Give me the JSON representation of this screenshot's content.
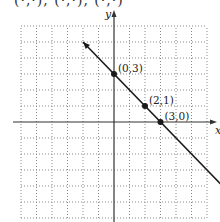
{
  "header": {
    "clipped_text": "(·,·), (·,·), (·,·)"
  },
  "chart_data": {
    "type": "line",
    "title": "",
    "xlabel": "x",
    "ylabel": "y",
    "xlim": [
      -6,
      6
    ],
    "ylim": [
      -6,
      6
    ],
    "grid": true,
    "grid_style": "dotted",
    "series": [
      {
        "name": "line",
        "equation": "y = -x + 3",
        "x": [
          -2,
          7.5
        ],
        "y": [
          5,
          -4.5
        ]
      }
    ],
    "points": [
      {
        "label": "(0, 3)",
        "x": 0,
        "y": 3
      },
      {
        "label": "(2, 1)",
        "x": 2,
        "y": 1
      },
      {
        "label": "(3, 0)",
        "x": 3,
        "y": 0
      }
    ]
  },
  "colors": {
    "line": "#1a1a1a",
    "grid": "#888888",
    "axis": "#333333"
  }
}
